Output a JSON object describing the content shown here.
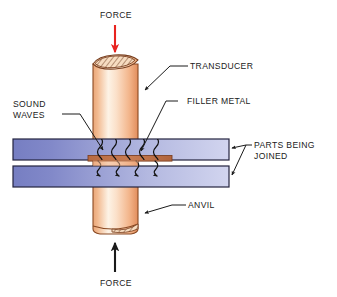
{
  "diagram": {
    "background_color": "#ffffff",
    "labels": {
      "force_top": "FORCE",
      "force_bottom": "FORCE",
      "transducer": "TRANSDUCER",
      "filler_metal": "FILLER METAL",
      "sound_waves_line1": "SOUND",
      "sound_waves_line2": "WAVES",
      "parts_joined_line1": "PARTS BEING",
      "parts_joined_line2": "JOINED",
      "anvil": "ANVIL"
    },
    "colors": {
      "force_arrow_top": "#e8231f",
      "force_arrow_bottom": "#1a1a1a",
      "transducer_light": "#fdf0e2",
      "transducer_mid": "#f4b183",
      "transducer_dark": "#e08c5a",
      "transducer_outline": "#6b3a1f",
      "plate_left": "#7b83c4",
      "plate_right": "#cdd0ec",
      "plate_outline": "#2a2a4a",
      "filler_metal": "#c0714a",
      "filler_metal_outline": "#7a3d1f",
      "leader_line": "#1a1a1a",
      "text": "#1a1a1a"
    },
    "elements": {
      "sound_wave_count": 5,
      "transmitted_arrow_count": 4,
      "hatch_cap_top": "hatched-ellipse-cap",
      "hatch_cap_bottom": "hatched-ellipse-cap"
    }
  }
}
